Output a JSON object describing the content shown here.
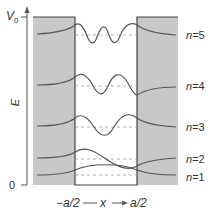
{
  "diagram": {
    "axis": {
      "y_label": "E",
      "top_tick": "V",
      "top_tick_sub": "0",
      "bottom_tick": "0"
    },
    "x_axis": {
      "left": "−a/2",
      "var": "x",
      "right": "a/2"
    },
    "levels": [
      {
        "n_label": "n",
        "n_value": "=5"
      },
      {
        "n_label": "n",
        "n_value": "=4"
      },
      {
        "n_label": "n",
        "n_value": "=3"
      },
      {
        "n_label": "n",
        "n_value": "=2"
      },
      {
        "n_label": "n",
        "n_value": "=1"
      }
    ],
    "colors": {
      "barrier": "#c8c8c8",
      "curve": "#555555",
      "dashed": "#9a9a9a",
      "outline": "#444444"
    }
  }
}
